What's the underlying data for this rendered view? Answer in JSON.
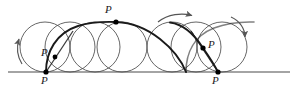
{
  "figure": {
    "type": "geometric-diagram",
    "canvas": {
      "width": 297,
      "height": 99
    },
    "colors": {
      "background": "#ffffff",
      "circle_stroke": "#555555",
      "curve_stroke": "#1a1a1a",
      "baseline_stroke": "#4a4a4a",
      "marker_fill": "#000000",
      "arrow_stroke": "#555555",
      "label_text": "#1a1a1a"
    },
    "baseline": {
      "label": "ground-line",
      "x1": 8,
      "x2": 290,
      "y": 72
    },
    "rolling_circles": {
      "count": 7,
      "radius": 25,
      "center_y": 47,
      "centers_x": [
        45,
        70,
        95,
        122,
        172,
        196,
        222
      ]
    },
    "cycloid": {
      "description": "curve traced by point P as the circle rolls right",
      "cusps_x": [
        46,
        218
      ],
      "apex": {
        "x": 116,
        "y": 22
      }
    },
    "point_markers": [
      {
        "name": "P-cusp-left",
        "x": 46,
        "y": 72,
        "label": "P"
      },
      {
        "name": "P-lower-left",
        "x": 55,
        "y": 57,
        "label": "P"
      },
      {
        "name": "P-apex",
        "x": 116,
        "y": 22,
        "label": "P"
      },
      {
        "name": "P-right-mid",
        "x": 203,
        "y": 48,
        "label": "P"
      },
      {
        "name": "P-cusp-right",
        "x": 218,
        "y": 72,
        "label": "P"
      }
    ],
    "labels": [
      {
        "name": "label-P-cusp-left",
        "text": "P",
        "x": 41,
        "y": 76
      },
      {
        "name": "label-P-lower-left",
        "text": "P",
        "x": 42,
        "y": 48
      },
      {
        "name": "label-P-apex",
        "text": "P",
        "x": 105,
        "y": 4
      },
      {
        "name": "label-P-right-mid",
        "text": "P",
        "x": 208,
        "y": 39
      },
      {
        "name": "label-P-cusp-right",
        "text": "P",
        "x": 212,
        "y": 76
      }
    ],
    "arrows": [
      {
        "name": "rotation-arrow-left",
        "direction": "up",
        "description": "curved arc arrow on left circle indicating rotation"
      },
      {
        "name": "translation-arrow-top",
        "direction": "right",
        "description": "curved arrow above the circles indicating rightward rolling motion"
      },
      {
        "name": "rotation-arrow-right",
        "direction": "down",
        "description": "curved arc arrow on right circle indicating clockwise rotation"
      }
    ]
  }
}
